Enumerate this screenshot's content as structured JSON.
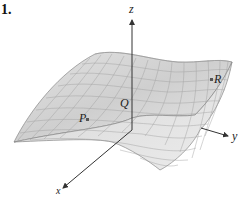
{
  "figure": {
    "number_label": "1.",
    "axes": {
      "z_label": "z",
      "y_label": "y",
      "x_label": "x"
    },
    "points": {
      "P": "P",
      "Q": "Q",
      "R": "R"
    },
    "colors": {
      "surface_fill": "#d9d9d9",
      "surface_light": "#ececec",
      "mesh_line": "#9a9a9a",
      "axis": "#333333"
    }
  }
}
